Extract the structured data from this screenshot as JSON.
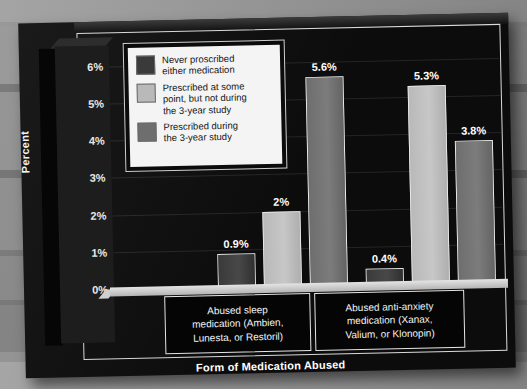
{
  "chart_data": {
    "type": "bar",
    "title": "",
    "xlabel": "Form of Medication Abused",
    "ylabel": "Percent",
    "ylim": [
      0,
      6.5
    ],
    "ytick_labels": [
      "0%",
      "1%",
      "2%",
      "3%",
      "4%",
      "5%",
      "6%"
    ],
    "ytick_values": [
      0,
      1,
      2,
      3,
      4,
      5,
      6
    ],
    "grid": true,
    "legend_position": "upper-left-inside",
    "categories": [
      "Abused sleep medication (Ambien, Lunesta, or Restoril)",
      "Abused anti-anxiety medication (Xanax, Valium, or Klonopin)"
    ],
    "series": [
      {
        "name": "Never prescribed either medication",
        "color": "#3a3a3a",
        "values": [
          0.9,
          0.4
        ],
        "labels": [
          "0.9%",
          "0.4%"
        ]
      },
      {
        "name": "Prescribed at some point, but not during the 3-year study",
        "color": "#b9b9b9",
        "values": [
          2.0,
          5.3
        ],
        "labels": [
          "2%",
          "5.3%"
        ]
      },
      {
        "name": "Prescribed during the 3-year study",
        "color": "#6e6e6e",
        "values": [
          5.6,
          3.8
        ],
        "labels": [
          "5.6%",
          "3.8%"
        ]
      }
    ]
  },
  "legend": {
    "items": [
      {
        "swatch_color": "#3a3a3a",
        "lines": [
          "Never proscribed",
          "either medication"
        ]
      },
      {
        "swatch_color": "#b9b9b9",
        "lines": [
          "Prescribed at some",
          "point, but not during",
          "the 3-year study"
        ]
      },
      {
        "swatch_color": "#6e6e6e",
        "lines": [
          "Prescribed during",
          "the 3-year study"
        ]
      }
    ]
  },
  "categories_display": [
    {
      "lines": [
        "Abused sleep",
        "medication (Ambien,",
        "Lunesta, or Restoril)"
      ]
    },
    {
      "lines": [
        "Abused anti-anxiety",
        "medication (Xanax,",
        "Valium, or Klonopin)"
      ]
    }
  ],
  "axis": {
    "y_title": "Percent",
    "x_title": "Form of Medication Abused",
    "ticks": [
      "6%",
      "5%",
      "4%",
      "3%",
      "2%",
      "1%",
      "0%"
    ]
  },
  "colors": {
    "panel": "#0c0c0c",
    "background": "#808080",
    "text_light": "#f2f2f2",
    "bar_dark": "#3a3a3a",
    "bar_light": "#b9b9b9",
    "bar_mid": "#6e6e6e",
    "legend_bg": "#f4f4f4"
  }
}
